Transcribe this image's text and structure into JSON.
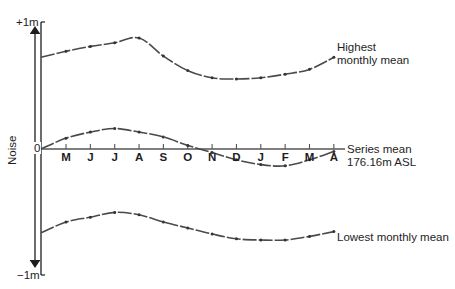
{
  "chart_data": {
    "type": "line",
    "title": "",
    "xlabel": "",
    "ylabel": "Noise",
    "y_tick_labels": {
      "top": "+1m",
      "zero": "0",
      "bottom": "−1m"
    },
    "ylim": [
      -1,
      1
    ],
    "categories": [
      "M",
      "J",
      "J",
      "A",
      "S",
      "O",
      "N",
      "D",
      "J",
      "F",
      "M",
      "A"
    ],
    "grid": false,
    "series": [
      {
        "name": "Highest monthly mean",
        "label_lines": [
          "Highest",
          "monthly mean"
        ],
        "start": 0.76,
        "values": [
          0.81,
          0.85,
          0.88,
          0.92,
          0.77,
          0.65,
          0.59,
          0.58,
          0.59,
          0.62,
          0.66,
          0.76
        ]
      },
      {
        "name": "Series mean 176.16m ASL",
        "label_lines": [
          "Series mean",
          "176.16m ASL"
        ],
        "start": 0.0,
        "values": [
          0.09,
          0.14,
          0.17,
          0.14,
          0.1,
          0.03,
          -0.03,
          -0.09,
          -0.13,
          -0.14,
          -0.09,
          -0.02
        ]
      },
      {
        "name": "Lowest monthly mean",
        "label_lines": [
          "Lowest monthly mean"
        ],
        "start": -0.7,
        "values": [
          -0.61,
          -0.57,
          -0.53,
          -0.55,
          -0.61,
          -0.66,
          -0.71,
          -0.75,
          -0.76,
          -0.76,
          -0.73,
          -0.69
        ]
      }
    ],
    "legend": "inline labels at right end of each series"
  }
}
